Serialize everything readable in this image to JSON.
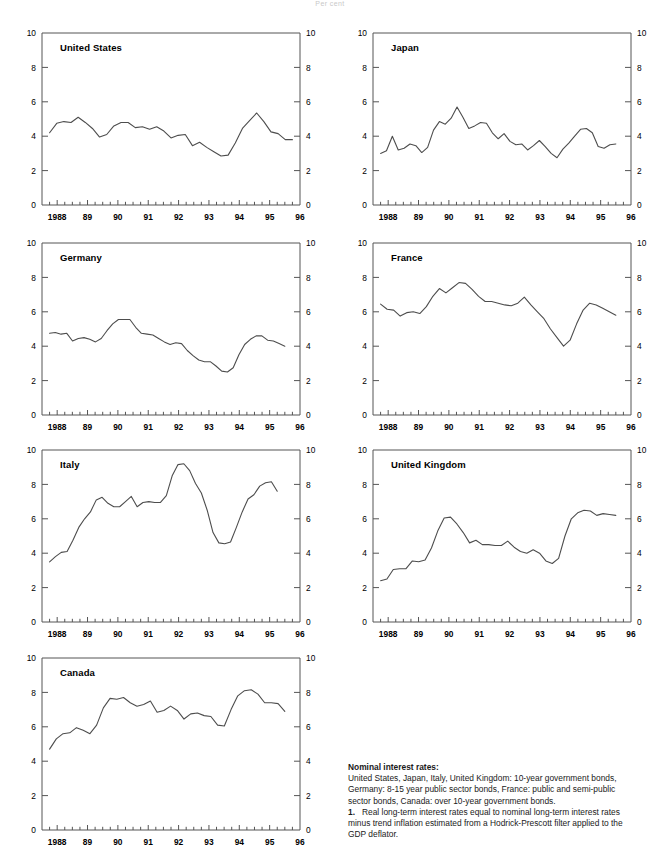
{
  "page": {
    "header_note": "Per cent"
  },
  "axes": {
    "y_ticks": [
      0,
      2,
      4,
      6,
      8,
      10
    ],
    "y_min": 0,
    "y_max": 10,
    "x_min": 1987.5,
    "x_max": 1996.0,
    "x_tick_labels": [
      {
        "x": 1988.0,
        "label": "1988"
      },
      {
        "x": 1989.0,
        "label": "89"
      },
      {
        "x": 1990.0,
        "label": "90"
      },
      {
        "x": 1991.0,
        "label": "91"
      },
      {
        "x": 1992.0,
        "label": "92"
      },
      {
        "x": 1993.0,
        "label": "93"
      },
      {
        "x": 1994.0,
        "label": "94"
      },
      {
        "x": 1995.0,
        "label": "95"
      },
      {
        "x": 1996.0,
        "label": "96"
      }
    ],
    "x_tick_step": 0.25,
    "line_color": "#4d4d4d",
    "axis_color": "#555555",
    "grid": false,
    "legend": "none"
  },
  "caption": {
    "heading": "Nominal interest rates:",
    "line1": "United States, Japan, Italy, United Kingdom: 10-year government bonds,",
    "line2": "Germany: 8-15 year public sector bonds, France: public and semi-public",
    "line3": "sector bonds, Canada: over 10-year government bonds.",
    "footnote_num": "1.",
    "footnote1": "Real long-term interest rates equal to nominal long-term interest rates",
    "footnote2": "minus trend inflation estimated from a Hodrick-Prescott filter applied to the",
    "footnote3": "GDP deflator."
  },
  "chart_data": [
    {
      "type": "line",
      "title": "United States",
      "xlabel": "",
      "ylabel": "",
      "ylim": [
        0,
        10
      ],
      "xlim": [
        1987.5,
        1996.0
      ],
      "x": [
        1987.75,
        1988.0,
        1988.25,
        1988.5,
        1988.75,
        1989.0,
        1989.25,
        1989.5,
        1989.75,
        1990.0,
        1990.25,
        1990.5,
        1990.75,
        1991.0,
        1991.25,
        1991.5,
        1991.75,
        1992.0,
        1992.25,
        1992.5,
        1992.75,
        1993.0,
        1993.25,
        1993.5,
        1993.75,
        1994.0,
        1994.25,
        1994.5,
        1994.75,
        1995.0,
        1995.25,
        1995.5,
        1995.75
      ],
      "values": [
        4.2,
        4.75,
        4.85,
        4.8,
        5.1,
        4.8,
        4.45,
        3.95,
        4.1,
        4.6,
        4.8,
        4.8,
        4.5,
        4.55,
        4.4,
        4.55,
        4.3,
        3.9,
        4.05,
        4.1,
        3.45,
        3.65,
        3.35,
        3.1,
        2.85,
        2.9,
        3.6,
        4.45,
        4.9,
        5.35,
        4.85,
        4.25,
        4.15,
        3.8,
        3.8
      ]
    },
    {
      "type": "line",
      "title": "Japan",
      "xlabel": "",
      "ylabel": "",
      "ylim": [
        0,
        10
      ],
      "xlim": [
        1987.5,
        1996.0
      ],
      "x": [
        1987.75,
        1988.0,
        1988.25,
        1988.5,
        1988.75,
        1989.0,
        1989.25,
        1989.5,
        1989.75,
        1990.0,
        1990.25,
        1990.5,
        1990.75,
        1991.0,
        1991.25,
        1991.5,
        1991.75,
        1992.0,
        1992.25,
        1992.5,
        1992.75,
        1993.0,
        1993.25,
        1993.5,
        1993.75,
        1994.0,
        1994.25,
        1994.5,
        1994.75,
        1995.0,
        1995.25,
        1995.5
      ],
      "values": [
        3.0,
        3.15,
        4.0,
        3.2,
        3.3,
        3.55,
        3.45,
        3.05,
        3.35,
        4.35,
        4.85,
        4.7,
        5.05,
        5.7,
        5.1,
        4.45,
        4.6,
        4.8,
        4.75,
        4.2,
        3.85,
        4.15,
        3.7,
        3.5,
        3.55,
        3.2,
        3.45,
        3.75,
        3.4,
        3.0,
        2.75,
        3.25,
        3.6,
        4.0,
        4.4,
        4.45,
        4.2,
        3.4,
        3.3,
        3.5,
        3.55
      ]
    },
    {
      "type": "line",
      "title": "Germany",
      "xlabel": "",
      "ylabel": "",
      "ylim": [
        0,
        10
      ],
      "xlim": [
        1987.5,
        1996.0
      ],
      "x": [
        1987.75,
        1988.0,
        1988.25,
        1988.5,
        1988.75,
        1989.0,
        1989.25,
        1989.5,
        1989.75,
        1990.0,
        1990.25,
        1990.5,
        1990.75,
        1991.0,
        1991.25,
        1991.5,
        1991.75,
        1992.0,
        1992.25,
        1992.5,
        1992.75,
        1993.0,
        1993.25,
        1993.5,
        1993.75,
        1994.0,
        1994.25,
        1994.5,
        1994.75,
        1995.0,
        1995.25,
        1995.5
      ],
      "values": [
        4.75,
        4.8,
        4.7,
        4.75,
        4.3,
        4.45,
        4.5,
        4.4,
        4.25,
        4.45,
        4.9,
        5.3,
        5.55,
        5.55,
        5.55,
        5.1,
        4.75,
        4.7,
        4.65,
        4.45,
        4.25,
        4.1,
        4.2,
        4.15,
        3.75,
        3.45,
        3.2,
        3.1,
        3.1,
        2.85,
        2.55,
        2.5,
        2.75,
        3.5,
        4.1,
        4.4,
        4.6,
        4.6,
        4.35,
        4.3,
        4.15,
        4.0
      ]
    },
    {
      "type": "line",
      "title": "France",
      "xlabel": "",
      "ylabel": "",
      "ylim": [
        0,
        10
      ],
      "xlim": [
        1987.5,
        1996.0
      ],
      "x": [
        1987.75,
        1988.0,
        1988.25,
        1988.5,
        1988.75,
        1989.0,
        1989.25,
        1989.5,
        1989.75,
        1990.0,
        1990.25,
        1990.5,
        1990.75,
        1991.0,
        1991.25,
        1991.5,
        1991.75,
        1992.0,
        1992.25,
        1992.5,
        1992.75,
        1993.0,
        1993.25,
        1993.5,
        1993.75,
        1994.0,
        1994.25,
        1994.5,
        1994.75,
        1995.0,
        1995.25,
        1995.5
      ],
      "values": [
        6.45,
        6.15,
        6.1,
        5.75,
        5.95,
        6.0,
        5.9,
        6.3,
        6.9,
        7.35,
        7.1,
        7.4,
        7.7,
        7.65,
        7.3,
        6.9,
        6.6,
        6.6,
        6.5,
        6.4,
        6.35,
        6.5,
        6.85,
        6.4,
        6.0,
        5.6,
        5.0,
        4.5,
        4.0,
        4.35,
        5.3,
        6.1,
        6.5,
        6.4,
        6.2,
        6.0,
        5.8
      ]
    },
    {
      "type": "line",
      "title": "Italy",
      "xlabel": "",
      "ylabel": "",
      "ylim": [
        0,
        10
      ],
      "xlim": [
        1987.5,
        1996.0
      ],
      "x": [
        1987.75,
        1988.0,
        1988.25,
        1988.5,
        1988.75,
        1989.0,
        1989.25,
        1989.5,
        1989.75,
        1990.0,
        1990.25,
        1990.5,
        1990.75,
        1991.0,
        1991.25,
        1991.5,
        1991.75,
        1992.0,
        1992.25,
        1992.5,
        1992.75,
        1993.0,
        1993.25,
        1993.5,
        1993.75,
        1994.0,
        1994.25,
        1994.5,
        1994.75,
        1995.0,
        1995.25
      ],
      "values": [
        3.5,
        3.8,
        4.05,
        4.1,
        4.75,
        5.5,
        6.0,
        6.4,
        7.1,
        7.25,
        6.9,
        6.7,
        6.7,
        7.0,
        7.3,
        6.7,
        6.95,
        7.0,
        6.95,
        6.95,
        7.35,
        8.5,
        9.15,
        9.2,
        8.8,
        8.05,
        7.5,
        6.5,
        5.2,
        4.6,
        4.55,
        4.65,
        5.5,
        6.4,
        7.15,
        7.4,
        7.9,
        8.1,
        8.15,
        7.6
      ]
    },
    {
      "type": "line",
      "title": "United Kingdom",
      "xlabel": "",
      "ylabel": "",
      "ylim": [
        0,
        10
      ],
      "xlim": [
        1987.5,
        1996.0
      ],
      "x": [
        1987.75,
        1988.0,
        1988.25,
        1988.5,
        1988.75,
        1989.0,
        1989.25,
        1989.5,
        1989.75,
        1990.0,
        1990.25,
        1990.5,
        1990.75,
        1991.0,
        1991.25,
        1991.5,
        1991.75,
        1992.0,
        1992.25,
        1992.5,
        1992.75,
        1993.0,
        1993.25,
        1993.5,
        1993.75,
        1994.0,
        1994.25,
        1994.5,
        1994.75,
        1995.0,
        1995.25,
        1995.5
      ],
      "values": [
        2.4,
        2.5,
        3.05,
        3.1,
        3.1,
        3.55,
        3.5,
        3.6,
        4.3,
        5.3,
        6.05,
        6.1,
        5.7,
        5.2,
        4.6,
        4.75,
        4.5,
        4.5,
        4.45,
        4.45,
        4.7,
        4.35,
        4.1,
        4.0,
        4.2,
        4.0,
        3.55,
        3.4,
        3.7,
        5.0,
        6.0,
        6.35,
        6.5,
        6.45,
        6.2,
        6.3,
        6.25,
        6.2
      ]
    },
    {
      "type": "line",
      "title": "Canada",
      "xlabel": "",
      "ylabel": "",
      "ylim": [
        0,
        10
      ],
      "xlim": [
        1987.5,
        1996.0
      ],
      "x": [
        1987.75,
        1988.0,
        1988.25,
        1988.5,
        1988.75,
        1989.0,
        1989.25,
        1989.5,
        1989.75,
        1990.0,
        1990.25,
        1990.5,
        1990.75,
        1991.0,
        1991.25,
        1991.5,
        1991.75,
        1992.0,
        1992.25,
        1992.5,
        1992.75,
        1993.0,
        1993.25,
        1993.5,
        1993.75,
        1994.0,
        1994.25,
        1994.5,
        1994.75,
        1995.0,
        1995.25,
        1995.5
      ],
      "values": [
        4.7,
        5.3,
        5.6,
        5.65,
        5.95,
        5.8,
        5.6,
        6.1,
        7.1,
        7.65,
        7.6,
        7.7,
        7.4,
        7.2,
        7.3,
        7.5,
        6.85,
        6.95,
        7.2,
        6.95,
        6.45,
        6.75,
        6.8,
        6.65,
        6.6,
        6.1,
        6.05,
        7.0,
        7.8,
        8.1,
        8.15,
        7.9,
        7.4,
        7.4,
        7.35,
        6.9
      ]
    }
  ],
  "panels": [
    {
      "name": "united-states",
      "col": 0,
      "row": 0
    },
    {
      "name": "japan",
      "col": 1,
      "row": 0
    },
    {
      "name": "germany",
      "col": 0,
      "row": 1
    },
    {
      "name": "france",
      "col": 1,
      "row": 1
    },
    {
      "name": "italy",
      "col": 0,
      "row": 2
    },
    {
      "name": "united-kingdom",
      "col": 1,
      "row": 2
    },
    {
      "name": "canada",
      "col": 0,
      "row": 3
    }
  ]
}
